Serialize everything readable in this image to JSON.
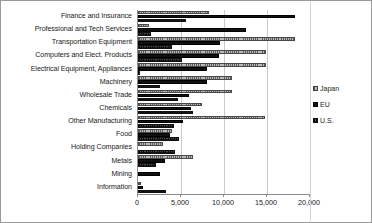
{
  "chart_data": {
    "type": "bar",
    "orientation": "horizontal",
    "title": "",
    "subtitle": "",
    "xlabel": "",
    "ylabel": "",
    "xlim": [
      0,
      20000
    ],
    "xticks": [
      0,
      5000,
      10000,
      15000,
      20000
    ],
    "xtick_labels": [
      "0",
      "5,000",
      "10,000",
      "15,000",
      "20,000"
    ],
    "grid": true,
    "grid_axis": "x",
    "legend_position": "right",
    "categories": [
      "Finance and Insurance",
      "Professional and Tech Services",
      "Transportation Equipment",
      "Computers and Elect. Products",
      "Electrical Equipment, Appliances",
      "Machinery",
      "Wholesale Trade",
      "Chemicals",
      "Other Manufacturing",
      "Food",
      "Holding Companies",
      "Metals",
      "Mining",
      "Information"
    ],
    "series": [
      {
        "name": "Japan",
        "color": "#b9b9b9",
        "values": [
          8300,
          1300,
          18300,
          14900,
          14900,
          10900,
          10900,
          7400,
          14800,
          3900,
          2900,
          6400,
          0,
          400
        ]
      },
      {
        "name": "EU",
        "color": "#101010",
        "values": [
          18200,
          12600,
          9500,
          9400,
          8000,
          8000,
          5900,
          6200,
          5200,
          3700,
          0,
          3100,
          2500,
          600
        ]
      },
      {
        "name": "U.S.",
        "color": "#4b4b4b",
        "values": [
          5600,
          1500,
          3900,
          5100,
          200,
          2500,
          4700,
          6400,
          4200,
          4800,
          4300,
          2100,
          0,
          3200
        ]
      }
    ]
  },
  "legend": {
    "items": [
      {
        "label": "Japan",
        "key": "japan"
      },
      {
        "label": "EU",
        "key": "eu"
      },
      {
        "label": "U.S.",
        "key": "us"
      }
    ]
  }
}
